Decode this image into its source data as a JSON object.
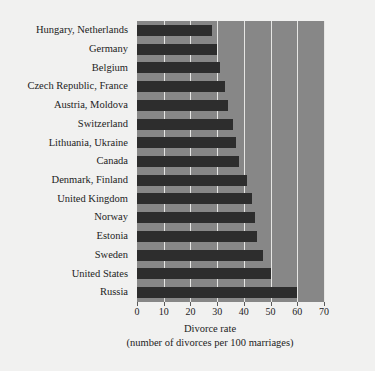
{
  "chart_data": {
    "type": "bar",
    "orientation": "horizontal",
    "title": "",
    "xlabel": "Divorce rate",
    "xlabel_sub": "(number of divorces per 100 marriages)",
    "ylabel": "",
    "xlim": [
      0,
      70
    ],
    "xticks": [
      0,
      10,
      20,
      30,
      40,
      50,
      60,
      70
    ],
    "grid": true,
    "legend": "none",
    "categories": [
      "Hungary, Netherlands",
      "Germany",
      "Belgium",
      "Czech Republic, France",
      "Austria, Moldova",
      "Switzerland",
      "Lithuania, Ukraine",
      "Canada",
      "Denmark, Finland",
      "United Kingdom",
      "Norway",
      "Estonia",
      "Sweden",
      "United States",
      "Russia"
    ],
    "values": [
      28,
      30,
      31,
      33,
      34,
      36,
      37,
      38,
      41,
      43,
      44,
      45,
      47,
      50,
      60
    ]
  },
  "colors": {
    "figure_background": "#f1f1f0",
    "plot_background": "#878787",
    "bar": "#2d2d2d",
    "gridline": "#e6e6e4",
    "text": "#232323"
  }
}
